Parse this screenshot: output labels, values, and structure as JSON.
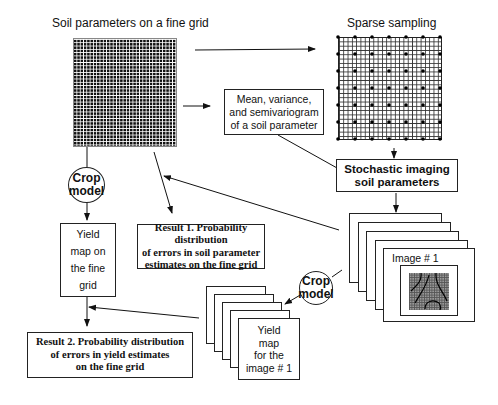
{
  "diagram": {
    "fine_grid": {
      "title": "Soil parameters on a fine grid"
    },
    "sparse_grid": {
      "title": "Sparse sampling"
    },
    "stats_box": {
      "line1": "Mean, variance,",
      "line2": "and semivariogram",
      "line3": "of a soil parameter"
    },
    "stochastic_box": {
      "line1": "Stochastic imaging",
      "line2": "soil parameters"
    },
    "crop_model_left": {
      "line1": "Crop",
      "line2": "model"
    },
    "crop_model_right": {
      "line1": "Crop",
      "line2": "model"
    },
    "yield_fine": {
      "line1": "Yield",
      "line2": "map on",
      "line3": "the fine",
      "line4": "grid"
    },
    "result1": {
      "line1": "Result 1. Probability distribution",
      "line2": "of  errors in soil parameter",
      "line3": "estimates on the fine grid"
    },
    "result2": {
      "line1": "Result 2. Probability distribution",
      "line2": "of  errors in yield estimates",
      "line3": "on the fine grid"
    },
    "image_stack": {
      "label": "Image # 1"
    },
    "yield_stack": {
      "line1": "Yield",
      "line2": "map",
      "line3": "for the",
      "line4": "image # 1"
    }
  }
}
